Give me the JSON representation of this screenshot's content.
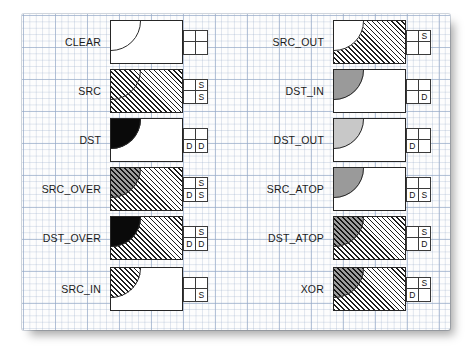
{
  "diagram": {
    "paper": "graph-paper",
    "colors": {
      "ink": "#1b1b1b",
      "grid_minor": "#96aac8",
      "grid_major": "#96aac8",
      "src_hatch": "#1d1d1d",
      "dst_dark": "#0a0a0a",
      "dst_gray": "#9a9a9a",
      "dst_gray_light": "#c8c8c8",
      "overlap_hatch": "#141414",
      "box_border": "#262626",
      "paper_bg": "#fdfdfd"
    },
    "key_legend": {
      "source_mark": "S",
      "dest_mark": "D"
    },
    "columns": [
      {
        "name": "left-column",
        "modes": [
          {
            "label": "CLEAR",
            "fig": {
              "src": "none",
              "dst": "none",
              "overlap": "none",
              "arc": true
            },
            "key": [
              "",
              "",
              "",
              ""
            ]
          },
          {
            "label": "SRC",
            "fig": {
              "src": "hatch-light",
              "dst": "none",
              "overlap": "hatch-light",
              "arc": true
            },
            "key": [
              "",
              "S",
              "",
              "S"
            ]
          },
          {
            "label": "DST",
            "fig": {
              "src": "none",
              "dst": "solid-black",
              "overlap": "solid-black",
              "arc": true
            },
            "key": [
              "",
              "",
              "D",
              "D"
            ]
          },
          {
            "label": "SRC_OVER",
            "fig": {
              "src": "hatch-light",
              "dst": "solid-black",
              "overlap": "hatch-dark",
              "arc": true
            },
            "key": [
              "",
              "S",
              "D",
              "S"
            ]
          },
          {
            "label": "DST_OVER",
            "fig": {
              "src": "hatch-light",
              "dst": "solid-black",
              "overlap": "solid-black",
              "arc": true
            },
            "key": [
              "",
              "S",
              "D",
              "D"
            ]
          },
          {
            "label": "SRC_IN",
            "fig": {
              "src": "none",
              "dst": "none",
              "overlap": "hatch-light",
              "arc": true
            },
            "key": [
              "",
              "",
              "",
              "S"
            ]
          }
        ]
      },
      {
        "name": "right-column",
        "modes": [
          {
            "label": "SRC_OUT",
            "fig": {
              "src": "hatch-light",
              "dst": "none",
              "overlap": "none",
              "arc": true
            },
            "key": [
              "",
              "S",
              "",
              ""
            ]
          },
          {
            "label": "DST_IN",
            "fig": {
              "src": "none",
              "dst": "none",
              "overlap": "gray-mid",
              "arc": true
            },
            "key": [
              "",
              "",
              "",
              "D"
            ]
          },
          {
            "label": "DST_OUT",
            "fig": {
              "src": "none",
              "dst": "none",
              "overlap": "gray-light",
              "arc": true
            },
            "key": [
              "",
              "",
              "D",
              ""
            ]
          },
          {
            "label": "SRC_ATOP",
            "fig": {
              "src": "none",
              "dst": "none",
              "overlap": "gray-mid",
              "arc": true
            },
            "key": [
              "",
              "",
              "D",
              "S"
            ]
          },
          {
            "label": "DST_ATOP",
            "fig": {
              "src": "hatch-light",
              "dst": "none",
              "overlap": "hatch-dark",
              "arc": true
            },
            "key": [
              "",
              "S",
              "",
              "D"
            ]
          },
          {
            "label": "XOR",
            "fig": {
              "src": "hatch-light",
              "dst": "none",
              "overlap": "hatch-dark",
              "arc": true
            },
            "key": [
              "",
              "S",
              "D",
              ""
            ]
          }
        ]
      }
    ]
  }
}
